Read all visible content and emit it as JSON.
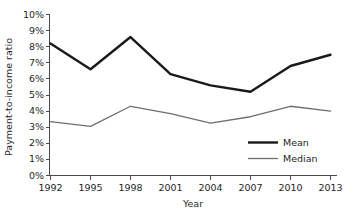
{
  "chart_data": {
    "type": "line",
    "title": "",
    "xlabel": "Year",
    "ylabel": "Payment-to-income ratio",
    "categories": [
      "1992",
      "1995",
      "1998",
      "2001",
      "2004",
      "2007",
      "2010",
      "2013"
    ],
    "x": [
      1992,
      1995,
      1998,
      2001,
      2004,
      2007,
      2010,
      2013
    ],
    "ylim": [
      0,
      10
    ],
    "xlim": [
      1992,
      2013
    ],
    "yticks": [
      0,
      1,
      2,
      3,
      4,
      5,
      6,
      7,
      8,
      9,
      10
    ],
    "ytick_labels": [
      "0%",
      "1%",
      "2%",
      "3%",
      "4%",
      "5%",
      "6%",
      "7%",
      "8%",
      "9%",
      "10%"
    ],
    "xtick_labels": [
      "1992",
      "1995",
      "1998",
      "2001",
      "2004",
      "2007",
      "2010",
      "2013"
    ],
    "grid": false,
    "legend_position": "center-right",
    "series": [
      {
        "name": "Mean",
        "values": [
          8.2,
          6.6,
          8.6,
          6.3,
          5.6,
          5.2,
          6.8,
          7.5
        ],
        "color": "#1a1a1a",
        "line_width": 2.4
      },
      {
        "name": "Median",
        "values": [
          3.35,
          3.05,
          4.3,
          3.85,
          3.25,
          3.65,
          4.3,
          4.0
        ],
        "color": "#6e6e6e",
        "line_width": 1.3
      }
    ]
  },
  "legend": {
    "items": [
      {
        "label": "Mean"
      },
      {
        "label": "Median"
      }
    ]
  },
  "axes": {
    "y_title": "Payment-to-income ratio",
    "x_title": "Year"
  }
}
